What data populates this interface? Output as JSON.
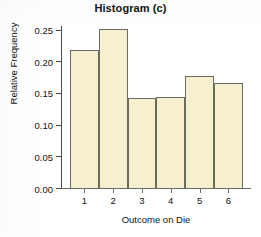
{
  "chart_data": {
    "type": "bar",
    "title": "Histogram (c)",
    "xlabel": "Outcome on Die",
    "ylabel": "Relative Frequency",
    "categories": [
      "1",
      "2",
      "3",
      "4",
      "5",
      "6"
    ],
    "values": [
      0.218,
      0.251,
      0.142,
      0.143,
      0.177,
      0.166
    ],
    "ylim": [
      0.0,
      0.265
    ],
    "xlim": [
      0.5,
      6.5
    ],
    "ytick_labels": [
      "0.00",
      "0.05",
      "0.10",
      "0.15",
      "0.20",
      "0.25"
    ],
    "ytick_values": [
      0.0,
      0.05,
      0.1,
      0.15,
      0.2,
      0.25
    ],
    "xtick_labels": [
      "1",
      "2",
      "3",
      "4",
      "5",
      "6"
    ],
    "grid": false,
    "legend": false,
    "bar_fill_color": "#f6f0cf",
    "bar_edge_color": "#6b6b60",
    "axis_color": "#4a4a46",
    "text_color": "#111111",
    "background_color": "#ffffff"
  }
}
